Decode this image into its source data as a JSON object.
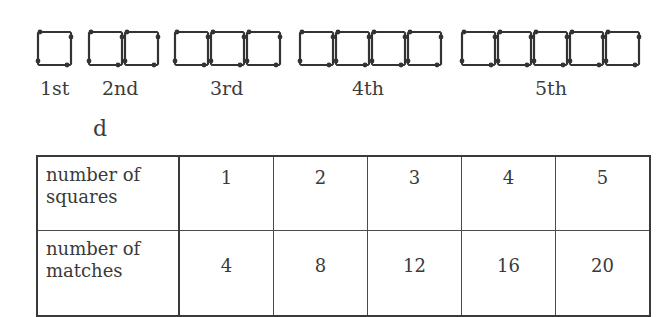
{
  "figure": {
    "pattern": {
      "description": "Matchstick squares arranged in a row, each term adding one square",
      "stroke_color": "#333333",
      "terms": [
        {
          "label": "1st",
          "squares": 1
        },
        {
          "label": "2nd",
          "squares": 2
        },
        {
          "label": "3rd",
          "squares": 3
        },
        {
          "label": "4th",
          "squares": 4
        },
        {
          "label": "5th",
          "squares": 5
        }
      ]
    },
    "part_letter": "d",
    "table": {
      "rows": [
        {
          "header_line1": "number of",
          "header_line2": "squares",
          "values": [
            "1",
            "2",
            "3",
            "4",
            "5"
          ]
        },
        {
          "header_line1": "number of",
          "header_line2": "matches",
          "values": [
            "4",
            "8",
            "12",
            "16",
            "20"
          ]
        }
      ]
    }
  }
}
